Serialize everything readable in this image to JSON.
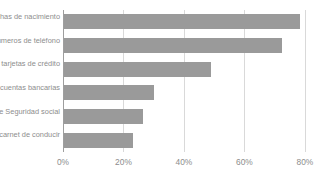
{
  "chart_data": {
    "type": "bar",
    "orientation": "horizontal",
    "title": "",
    "xlabel": "",
    "ylabel": "",
    "categories": [
      "Fechas de nacimiento",
      "Números de teléfono",
      "Información de tarjetas de crédito",
      "Números de cuentas bancarias",
      "Números de Seguridad social",
      "Información del carnet de conducir"
    ],
    "values": [
      78.5,
      72.5,
      49,
      30,
      26.5,
      23
    ],
    "value_suffix": "%",
    "xlim": [
      0,
      85
    ],
    "xticks": [
      0,
      20,
      40,
      60,
      80
    ],
    "xtick_labels": [
      "0%",
      "20%",
      "40%",
      "60%",
      "80%"
    ],
    "grid": true,
    "grid_axis": "x",
    "legend": false,
    "bar_color": "#9a9a9a",
    "grid_color": "#d9d9d9",
    "axis_color": "#9e9e9e",
    "text_color": "#8d8d8d",
    "background": "#ffffff"
  }
}
